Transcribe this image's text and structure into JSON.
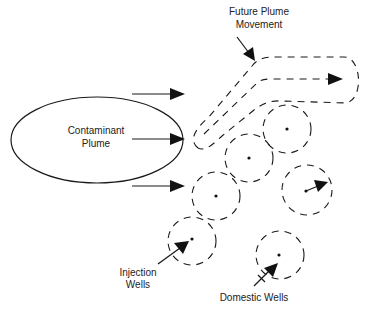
{
  "diagram": {
    "nodes": {
      "contaminant_plume": {
        "label_line1": "Contaminant",
        "label_line2": "Plume",
        "shape": "ellipse"
      },
      "future_plume": {
        "label_line1": "Future Plume",
        "label_line2": "Movement",
        "shape": "dashed-outline-arrow"
      },
      "injection_wells": {
        "label_line1": "Injection",
        "label_line2": "Wells",
        "shape": "dashed-circle-with-dot"
      },
      "domestic_wells": {
        "label": "Domestic Wells",
        "shape": "dashed-circle-with-dot"
      }
    },
    "flow_arrows": [
      {
        "from": "contaminant_plume",
        "direction": "right",
        "position": "top"
      },
      {
        "from": "contaminant_plume",
        "direction": "right",
        "position": "middle"
      },
      {
        "from": "contaminant_plume",
        "direction": "right",
        "position": "bottom"
      }
    ],
    "well_circles": [
      {
        "type": "capture-zone",
        "cx": 287,
        "cy": 129
      },
      {
        "type": "capture-zone",
        "cx": 249,
        "cy": 158
      },
      {
        "type": "capture-zone",
        "cx": 216,
        "cy": 196
      },
      {
        "type": "capture-zone",
        "cx": 307,
        "cy": 190,
        "has_outward_arrow": true
      },
      {
        "type": "injection-well",
        "cx": 192,
        "cy": 240
      },
      {
        "type": "domestic-well",
        "cx": 279,
        "cy": 255
      }
    ],
    "colors": {
      "stroke": "#1a1a1a",
      "background": "#ffffff",
      "text": "#222222"
    }
  }
}
